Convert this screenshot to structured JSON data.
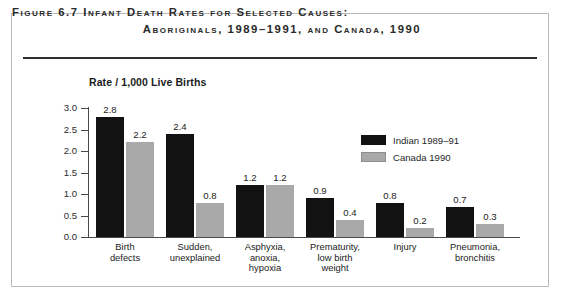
{
  "figure": {
    "title_line1": "Figure 6.7 Infant Death Rates for Selected Causes:",
    "title_line2": "Aboriginals, 1989–1991, and Canada, 1990"
  },
  "legend": {
    "position": "inside-top-right",
    "entries": [
      {
        "label": "Indian 1989–91",
        "color": "#121212"
      },
      {
        "label": "Canada 1990",
        "color": "#a9a9a9"
      }
    ]
  },
  "chart_data": {
    "type": "bar",
    "title": "Figure 6.7 Infant Death Rates for Selected Causes: Aboriginals, 1989–1991, and Canada, 1990",
    "xlabel": "",
    "ylabel": "Rate / 1,000 Live Births",
    "ylim": [
      0,
      3.0
    ],
    "yticks": [
      "0.0",
      "0.5",
      "1.0",
      "1.5",
      "2.0",
      "2.5",
      "3.0"
    ],
    "grid": false,
    "categories": [
      "Birth\ndefects",
      "Sudden,\nunexplained",
      "Asphyxia,\nanoxia,\nhypoxia",
      "Prematurity,\nlow birth\nweight",
      "Injury",
      "Pneumonia,\nbronchitis"
    ],
    "category_lines": [
      [
        "Birth",
        "defects"
      ],
      [
        "Sudden,",
        "unexplained"
      ],
      [
        "Asphyxia,",
        "anoxia,",
        "hypoxia"
      ],
      [
        "Prematurity,",
        "low birth",
        "weight"
      ],
      [
        "Injury"
      ],
      [
        "Pneumonia,",
        "bronchitis"
      ]
    ],
    "series": [
      {
        "name": "Indian 1989–91",
        "color": "#121212",
        "values": [
          2.8,
          2.4,
          1.2,
          0.9,
          0.8,
          0.7
        ],
        "labels": [
          "2.8",
          "2.4",
          "1.2",
          "0.9",
          "0.8",
          "0.7"
        ]
      },
      {
        "name": "Canada 1990",
        "color": "#a9a9a9",
        "values": [
          2.2,
          0.8,
          1.2,
          0.4,
          0.2,
          0.3
        ],
        "labels": [
          "2.2",
          "0.8",
          "1.2",
          "0.4",
          "0.2",
          "0.3"
        ]
      }
    ]
  }
}
